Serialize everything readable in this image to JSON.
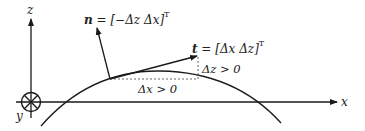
{
  "diagram": {
    "axes": {
      "x_label": "x",
      "y_label": "y",
      "z_label": "z"
    },
    "normal_vector": {
      "symbol": "n",
      "equals": " = ",
      "expr": "[−Δz Δx]",
      "superscript": "T"
    },
    "tangent_vector": {
      "symbol": "t",
      "equals": " = ",
      "expr": "[Δx Δz]",
      "superscript": "T"
    },
    "dx_label": "Δx > 0",
    "dz_label": "Δz > 0",
    "colors": {
      "line": "#1a1a1a",
      "dashed": "#555555"
    }
  }
}
